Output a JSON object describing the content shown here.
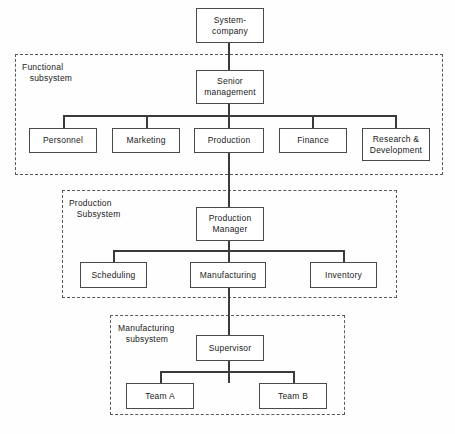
{
  "diagram": {
    "background_color": "#fefefe",
    "line_color": "#3a3a3a",
    "box_border_color": "#4a4a4a",
    "groups": [
      {
        "id": "functional",
        "label": "Functional\n   subsystem"
      },
      {
        "id": "production",
        "label": "Production\n   Subsystem"
      },
      {
        "id": "manufacturing",
        "label": "Manufacturing\n   subsystem"
      }
    ],
    "nodes": {
      "system_company": "System-\ncompany",
      "senior_management": "Senior\nmanagement",
      "personnel": "Personnel",
      "marketing": "Marketing",
      "production": "Production",
      "finance": "Finance",
      "research_development": "Research &\nDevelopment",
      "production_manager": "Production\nManager",
      "scheduling": "Scheduling",
      "manufacturing": "Manufacturing",
      "inventory": "Inventory",
      "supervisor": "Supervisor",
      "team_a": "Team A",
      "team_b": "Team B"
    }
  }
}
